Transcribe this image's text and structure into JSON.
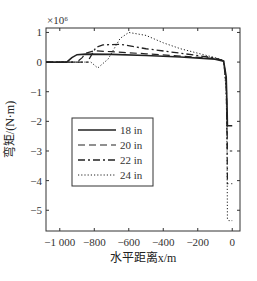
{
  "chart_data": {
    "type": "line",
    "title": "",
    "xlabel": "水平距离x/m",
    "ylabel": "弯矩/(N·m)",
    "y_multiplier": "×10⁶",
    "xlim": [
      -1080,
      45
    ],
    "ylim": [
      -5.7,
      1.15
    ],
    "xticks": [
      -1000,
      -800,
      -600,
      -400,
      -200,
      0
    ],
    "xtick_labels": [
      "−1 000",
      "−800",
      "−600",
      "−400",
      "−200",
      "0"
    ],
    "yticks": [
      1,
      0,
      -1,
      -2,
      -3,
      -4,
      -5
    ],
    "ytick_labels": [
      "1",
      "0",
      "−1",
      "−2",
      "−3",
      "−4",
      "−5"
    ],
    "legend_position": "center-left",
    "series": [
      {
        "name": "18 in",
        "style": "solid",
        "x": [
          -1080,
          -960,
          -930,
          -900,
          -850,
          -700,
          -500,
          -300,
          -100,
          -50,
          -35,
          -30,
          -28,
          -25,
          0
        ],
        "y": [
          0,
          0,
          0.15,
          0.25,
          0.27,
          0.26,
          0.22,
          0.17,
          0.1,
          0.03,
          -0.5,
          -1.5,
          -2.15,
          -2.15,
          -2.15
        ]
      },
      {
        "name": "20 in",
        "style": "dashed",
        "x": [
          -1080,
          -900,
          -870,
          -850,
          -800,
          -700,
          -500,
          -300,
          -100,
          -50,
          -35,
          -30,
          -28,
          -25,
          0
        ],
        "y": [
          0,
          0,
          0.15,
          0.3,
          0.38,
          0.35,
          0.28,
          0.2,
          0.12,
          0.04,
          -0.6,
          -2.0,
          -3.0,
          -3.0,
          -3.0
        ]
      },
      {
        "name": "22 in",
        "style": "dashdot",
        "x": [
          -1080,
          -840,
          -810,
          -790,
          -750,
          -650,
          -500,
          -300,
          -100,
          -50,
          -35,
          -30,
          -28,
          -25,
          0
        ],
        "y": [
          0,
          0,
          0.3,
          0.5,
          0.58,
          0.6,
          0.45,
          0.3,
          0.14,
          0.05,
          -0.8,
          -2.5,
          -4.1,
          -4.1,
          -4.1
        ]
      },
      {
        "name": "24 in",
        "style": "dotted",
        "x": [
          -1080,
          -820,
          -780,
          -720,
          -650,
          -600,
          -500,
          -400,
          -300,
          -200,
          -100,
          -50,
          -35,
          -30,
          -28,
          -20,
          0
        ],
        "y": [
          0,
          0,
          -0.2,
          0.1,
          0.8,
          1.0,
          0.9,
          0.65,
          0.45,
          0.3,
          0.15,
          0.05,
          -1.0,
          -3.0,
          -5.3,
          -5.35,
          -5.35
        ]
      }
    ]
  }
}
